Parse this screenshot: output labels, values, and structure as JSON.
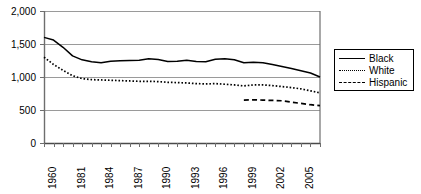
{
  "chart_data": {
    "type": "line",
    "title": "",
    "xlabel": "",
    "ylabel": "",
    "ylim": [
      0,
      2000
    ],
    "yticks": [
      0,
      500,
      1000,
      1500,
      2000
    ],
    "ytick_labels": [
      "0",
      "500",
      "1,000",
      "1,500",
      "2,000"
    ],
    "grid": true,
    "legend_position": "right",
    "x_tick_labels": [
      "1960",
      "1981",
      "1984",
      "1987",
      "1990",
      "1993",
      "1996",
      "1999",
      "2002",
      "2005"
    ],
    "x_label_years": [
      1960,
      1981,
      1984,
      1987,
      1990,
      1993,
      1996,
      1999,
      2002,
      2005
    ],
    "x": [
      1960,
      1979,
      1980,
      1981,
      1982,
      1983,
      1984,
      1985,
      1986,
      1987,
      1988,
      1989,
      1990,
      1991,
      1992,
      1993,
      1994,
      1995,
      1996,
      1997,
      1998,
      1999,
      2000,
      2001,
      2002,
      2003,
      2004,
      2005,
      2006,
      2007
    ],
    "series": [
      {
        "name": "Black",
        "style": "solid",
        "color": "#000000",
        "values": [
          1600,
          1560,
          1450,
          1320,
          1260,
          1230,
          1215,
          1240,
          1245,
          1250,
          1255,
          1275,
          1265,
          1235,
          1240,
          1255,
          1235,
          1230,
          1270,
          1275,
          1260,
          1215,
          1225,
          1215,
          1190,
          1160,
          1130,
          1095,
          1060,
          1000
        ]
      },
      {
        "name": "White",
        "style": "dotted",
        "color": "#000000",
        "values": [
          1300,
          1190,
          1100,
          1020,
          975,
          960,
          955,
          950,
          945,
          940,
          935,
          935,
          930,
          920,
          915,
          910,
          900,
          895,
          900,
          890,
          880,
          865,
          880,
          880,
          870,
          855,
          840,
          820,
          790,
          760
        ]
      },
      {
        "name": "Hispanic",
        "style": "dashed",
        "color": "#000000",
        "values": [
          null,
          null,
          null,
          null,
          null,
          null,
          null,
          null,
          null,
          null,
          null,
          null,
          null,
          null,
          null,
          null,
          null,
          null,
          null,
          null,
          null,
          650,
          655,
          650,
          645,
          640,
          620,
          600,
          580,
          565
        ]
      }
    ]
  },
  "legend": {
    "items": [
      {
        "label": "Black",
        "style": "solid"
      },
      {
        "label": "White",
        "style": "dotted"
      },
      {
        "label": "Hispanic",
        "style": "dashed"
      }
    ]
  }
}
